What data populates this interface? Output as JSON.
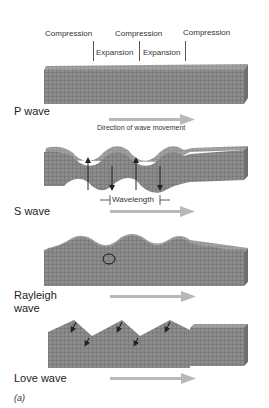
{
  "p_wave": {
    "labels_top": [
      "Compression",
      "Compression",
      "Compression"
    ],
    "labels_mid": [
      "Expansion",
      "Expansion"
    ],
    "name": "P wave",
    "direction_caption": "Direction of wave movement"
  },
  "s_wave": {
    "name": "S wave",
    "wavelength_label": "Wavelength"
  },
  "rayleigh_wave": {
    "name_line1": "Rayleigh",
    "name_line2": "wave"
  },
  "love_wave": {
    "name": "Love wave"
  },
  "panel_label": "(a)",
  "colors": {
    "block_front": "#8a8a8a",
    "block_top": "#a0a0a0",
    "block_side": "#6e6e6e",
    "grid": "#5c5c5c",
    "arrow": "#b8b8b8"
  }
}
